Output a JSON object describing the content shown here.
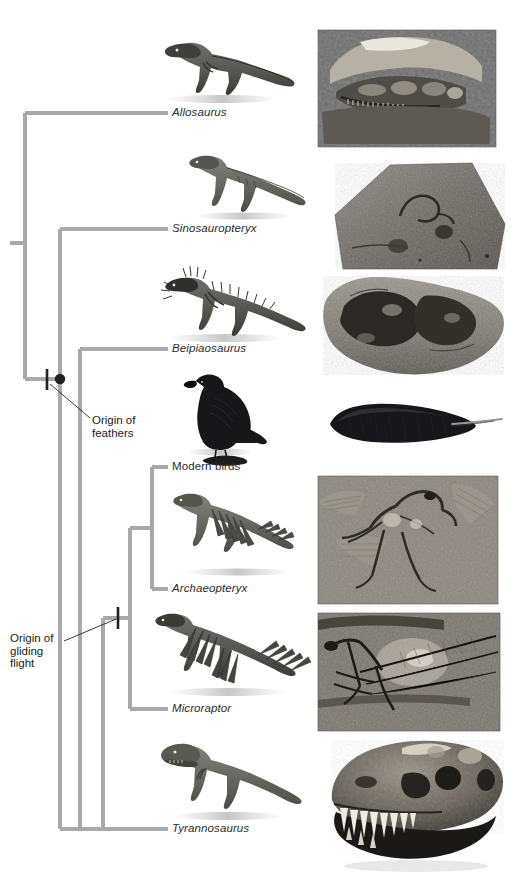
{
  "figure": {
    "kind": "cladogram",
    "title": "",
    "background_color": "#ffffff",
    "branch_color": "#a7a9ac",
    "branch_width": 4,
    "node_color": "#231f20",
    "text_color": "#231f20"
  },
  "taxa": [
    {
      "id": "allosaurus",
      "label": "Allosaurus",
      "style": "scientific",
      "tip_y": 113,
      "label_x": 172,
      "label_y": 107
    },
    {
      "id": "sinosauropteryx",
      "label": "Sinosauropteryx",
      "style": "scientific",
      "tip_y": 229,
      "label_x": 172,
      "label_y": 223
    },
    {
      "id": "beipiaosaurus",
      "label": "Beipiaosaurus",
      "style": "scientific",
      "tip_y": 349,
      "label_x": 172,
      "label_y": 343
    },
    {
      "id": "modern-birds",
      "label": "Modern birds",
      "style": "common",
      "tip_y": 467,
      "label_x": 172,
      "label_y": 461
    },
    {
      "id": "archaeopteryx",
      "label": "Archaeopteryx",
      "style": "scientific",
      "tip_y": 589,
      "label_x": 172,
      "label_y": 583
    },
    {
      "id": "microraptor",
      "label": "Microraptor",
      "style": "scientific",
      "tip_y": 709,
      "label_x": 172,
      "label_y": 703
    },
    {
      "id": "tyrannosaurus",
      "label": "Tyrannosaurus",
      "style": "scientific",
      "tip_y": 829,
      "label_x": 172,
      "label_y": 823
    }
  ],
  "annotations": [
    {
      "id": "origin-of-feathers",
      "text": "Origin of\nfeathers",
      "x": 92,
      "y": 414,
      "marker": {
        "type": "hash-mark",
        "x": 47,
        "y": 379
      },
      "node": {
        "type": "filled-circle",
        "x": 60,
        "y": 379,
        "r": 5
      },
      "leader": {
        "x1": 50,
        "y1": 384,
        "x2": 90,
        "y2": 418
      }
    },
    {
      "id": "origin-of-gliding-flight",
      "text": "Origin of\ngliding\nflight",
      "x": 10,
      "y": 632,
      "marker": {
        "type": "hash-mark",
        "x": 118,
        "y": 618
      },
      "leader": {
        "x1": 63,
        "y1": 641,
        "x2": 116,
        "y2": 620
      }
    }
  ],
  "tree_nodes": [
    {
      "id": "root",
      "x": 25,
      "y": 243,
      "stub": true
    },
    {
      "id": "node-a",
      "x": 25,
      "y": 379,
      "children": [
        "allosaurus",
        "node-b"
      ]
    },
    {
      "id": "node-b",
      "x": 60,
      "y": 379,
      "children": [
        "sinosauropteryx",
        "node-c"
      ]
    },
    {
      "id": "node-c",
      "x": 80,
      "y": 829,
      "children": [
        "beipiaosaurus",
        "node-d"
      ]
    },
    {
      "id": "node-d",
      "x": 103,
      "y": 618,
      "children": [
        "node-e",
        "tyrannosaurus"
      ]
    },
    {
      "id": "node-e",
      "x": 130,
      "y": 618,
      "children": [
        "node-f",
        "microraptor"
      ]
    },
    {
      "id": "node-f",
      "x": 152,
      "y": 528,
      "children": [
        "modern-birds",
        "archaeopteryx"
      ]
    }
  ],
  "organisms": [
    {
      "id": "allosaurus-illustration",
      "taxon": "allosaurus",
      "x": 155,
      "y": 28,
      "w": 140,
      "h": 72
    },
    {
      "id": "sinosauropteryx-illustration",
      "taxon": "sinosauropteryx",
      "x": 178,
      "y": 150,
      "w": 130,
      "h": 68
    },
    {
      "id": "beipiaosaurus-illustration",
      "taxon": "beipiaosaurus",
      "x": 148,
      "y": 262,
      "w": 160,
      "h": 78
    },
    {
      "id": "modern-bird-illustration",
      "taxon": "modern-birds",
      "x": 183,
      "y": 372,
      "w": 78,
      "h": 82
    },
    {
      "id": "archaeopteryx-illustration",
      "taxon": "archaeopteryx",
      "x": 165,
      "y": 490,
      "w": 150,
      "h": 85
    },
    {
      "id": "microraptor-illustration",
      "taxon": "microraptor",
      "x": 145,
      "y": 608,
      "w": 170,
      "h": 88
    },
    {
      "id": "tyrannosaurus-illustration",
      "taxon": "tyrannosaurus",
      "x": 152,
      "y": 738,
      "w": 155,
      "h": 80
    }
  ],
  "photos": [
    {
      "id": "allosaurus-skull-fossil",
      "subject": "Allosaurus skull in rock matrix",
      "x": 318,
      "y": 30,
      "w": 178,
      "h": 117,
      "shape": "rect"
    },
    {
      "id": "sinosauropteryx-slab-fossil",
      "subject": "Sinosauropteryx fossil slab",
      "x": 335,
      "y": 163,
      "w": 170,
      "h": 106,
      "shape": "polygon"
    },
    {
      "id": "beipiaosaurus-fossil",
      "subject": "Beipiaosaurus fossil block",
      "x": 322,
      "y": 276,
      "w": 180,
      "h": 100,
      "shape": "irregular"
    },
    {
      "id": "modern-bird-feather",
      "subject": "Black contour feather",
      "x": 322,
      "y": 405,
      "w": 186,
      "h": 38,
      "shape": "feather"
    },
    {
      "id": "archaeopteryx-fossil",
      "subject": "Archaeopteryx fossil slab",
      "x": 318,
      "y": 476,
      "w": 180,
      "h": 128,
      "shape": "rect"
    },
    {
      "id": "microraptor-fossil",
      "subject": "Microraptor fossil slab",
      "x": 318,
      "y": 613,
      "w": 182,
      "h": 118,
      "shape": "rect"
    },
    {
      "id": "tyrannosaurus-skull",
      "subject": "Tyrannosaurus rex skull",
      "x": 320,
      "y": 742,
      "w": 184,
      "h": 140,
      "shape": "skull"
    }
  ]
}
